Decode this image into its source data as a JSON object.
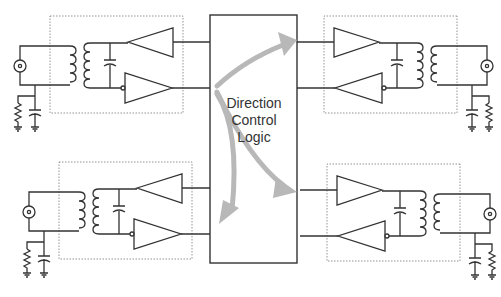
{
  "diagram": {
    "central_block": {
      "line1": "Direction",
      "line2": "Control",
      "line3": "Logic"
    },
    "channels": [
      {
        "id": "top-left",
        "side": "left"
      },
      {
        "id": "top-right",
        "side": "right"
      },
      {
        "id": "bottom-left",
        "side": "left"
      },
      {
        "id": "bottom-right",
        "side": "right"
      }
    ],
    "colors": {
      "wire": "#333333",
      "dotted_box": "#888888",
      "arrow": "#b8b8b8"
    }
  }
}
